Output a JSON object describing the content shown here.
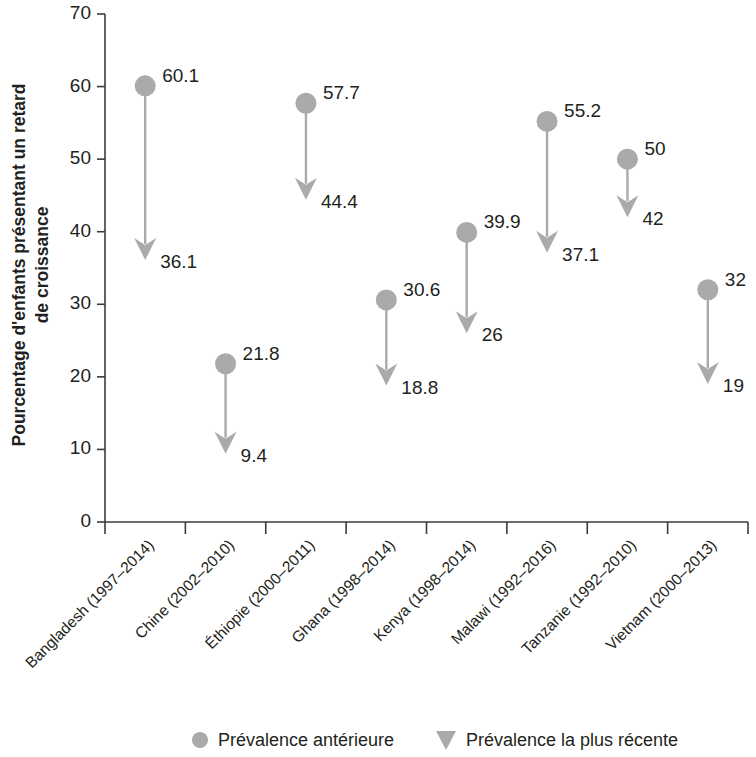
{
  "chart_data": {
    "type": "scatter",
    "title": "",
    "subtitle": "",
    "xlabel": "",
    "ylabel": "Pourcentage d'enfants présentant un retard de croissance",
    "ylabel_lines": [
      "Pourcentage d'enfants présentant un retard",
      "de croissance"
    ],
    "ylim": [
      0,
      70
    ],
    "yticks": [
      0,
      10,
      20,
      30,
      40,
      50,
      60,
      70
    ],
    "ytick_labels": [
      "0",
      "10",
      "20",
      "30",
      "40",
      "50",
      "60",
      "70"
    ],
    "grid": false,
    "legend_position": "bottom",
    "categories": [
      "Bangladesh (1997–2014)",
      "Chine (2002–2010)",
      "Éthiopie (2000–2011)",
      "Ghana (1998–2014)",
      "Kenya (1998–2014)",
      "Malawi (1992–2016)",
      "Tanzanie (1992–2010)",
      "Vietnam (2000–2013)"
    ],
    "series": [
      {
        "name": "Prévalence antérieure",
        "marker": "circle",
        "color": "#aaaaaa",
        "values": [
          60.1,
          21.8,
          57.7,
          30.6,
          39.9,
          55.2,
          50,
          32
        ],
        "value_labels": [
          "60.1",
          "21.8",
          "57.7",
          "30.6",
          "39.9",
          "55.2",
          "50",
          "32"
        ]
      },
      {
        "name": "Prévalence la plus récente",
        "marker": "down-triangle-arrow",
        "color": "#aaaaaa",
        "values": [
          36.1,
          9.4,
          44.4,
          18.8,
          26,
          37.1,
          42,
          19
        ],
        "value_labels": [
          "36.1",
          "9.4",
          "44.4",
          "18.8",
          "26",
          "37.1",
          "42",
          "19"
        ]
      }
    ],
    "annotations": [
      {
        "category": "Bangladesh (1997–2014)",
        "start": 60.1,
        "end": 36.1,
        "start_label": "60.1",
        "end_label": "36.1"
      },
      {
        "category": "Chine (2002–2010)",
        "start": 21.8,
        "end": 9.4,
        "start_label": "21.8",
        "end_label": "9.4"
      },
      {
        "category": "Éthiopie (2000–2011)",
        "start": 57.7,
        "end": 44.4,
        "start_label": "57.7",
        "end_label": "44.4"
      },
      {
        "category": "Ghana (1998–2014)",
        "start": 30.6,
        "end": 18.8,
        "start_label": "30.6",
        "end_label": "18.8"
      },
      {
        "category": "Kenya (1998–2014)",
        "start": 39.9,
        "end": 26,
        "start_label": "39.9",
        "end_label": "26"
      },
      {
        "category": "Malawi (1992–2016)",
        "start": 55.2,
        "end": 37.1,
        "start_label": "55.2",
        "end_label": "37.1"
      },
      {
        "category": "Tanzanie (1992–2010)",
        "start": 50,
        "end": 42,
        "start_label": "50",
        "end_label": "42"
      },
      {
        "category": "Vietnam (2000–2013)",
        "start": 32,
        "end": 19,
        "start_label": "32",
        "end_label": "19"
      }
    ]
  },
  "legend": {
    "items": [
      {
        "label": "Prévalence antérieure",
        "marker": "circle",
        "color": "#aaaaaa"
      },
      {
        "label": "Prévalence la plus récente",
        "marker": "down-triangle",
        "color": "#aaaaaa"
      }
    ]
  },
  "colors": {
    "marker_gray": "#aaaaaa",
    "axis": "#3b3b3b",
    "text": "#231f20",
    "background": "#ffffff"
  }
}
